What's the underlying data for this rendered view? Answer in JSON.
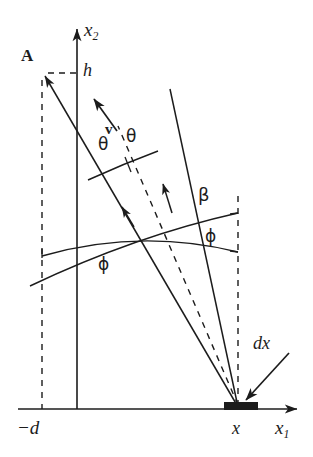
{
  "figure": {
    "kind": "geometry-diagram",
    "background_color": "#ffffff",
    "stroke_color": "#1c1c1c"
  },
  "axes": {
    "vertical": {
      "label": "x",
      "subscript": "2",
      "name": "x2-axis",
      "x_px": 77,
      "top_px": 24,
      "bottom_px": 409,
      "arrow": "up"
    },
    "horizontal": {
      "label": "x",
      "subscript": "1",
      "name": "x1-axis",
      "y_px": 409,
      "left_px": 18,
      "right_px": 302,
      "arrow": "right"
    },
    "origin_px": [
      77,
      409
    ]
  },
  "labels": {
    "point_a": "A",
    "height_h": "h",
    "offset_d": "−d",
    "position_x": "x",
    "element_dx": "dx",
    "velocity_v": "v",
    "theta_left": "θ",
    "theta_right": "θ",
    "phi_left": "ϕ",
    "phi_right": "ϕ",
    "beta": "β",
    "x_axis_name": "x",
    "x_axis_sub": "1",
    "y_axis_name": "x",
    "y_axis_sub": "2"
  },
  "geometry": {
    "apex_px": [
      238,
      407
    ],
    "point_a_px": [
      42,
      73
    ],
    "dx_element": {
      "x_px": 224,
      "y_px": 402,
      "width_px": 34,
      "height_px": 8,
      "name": "surface-element-dx"
    },
    "dashed_vertical_left_x_px": 42,
    "dashed_vertical_right_x_px": 238,
    "dashed_horizontal_h_y_px": 73,
    "cone_left_line": [
      [
        42,
        73
      ],
      [
        238,
        407
      ]
    ],
    "cone_right_line": [
      [
        170,
        89
      ],
      [
        238,
        407
      ]
    ],
    "cone_bisector_dashed": [
      [
        118,
        125
      ],
      [
        238,
        407
      ]
    ],
    "arc_theta": [
      [
        88,
        179
      ],
      [
        157,
        152
      ]
    ],
    "arc_phi_inner": [
      [
        42,
        256
      ],
      [
        238,
        252
      ]
    ],
    "arc_beta_outer": [
      [
        30,
        286
      ],
      [
        238,
        213
      ]
    ],
    "arrow_v": [
      [
        116,
        130
      ],
      [
        93,
        97
      ]
    ],
    "arrowhead_on_left_cone_px": [
      126,
      213
    ],
    "arrowhead_on_right_cone_px": [
      166,
      191
    ],
    "dx_callout_arrow": [
      [
        289,
        354
      ],
      [
        247,
        402
      ]
    ]
  }
}
